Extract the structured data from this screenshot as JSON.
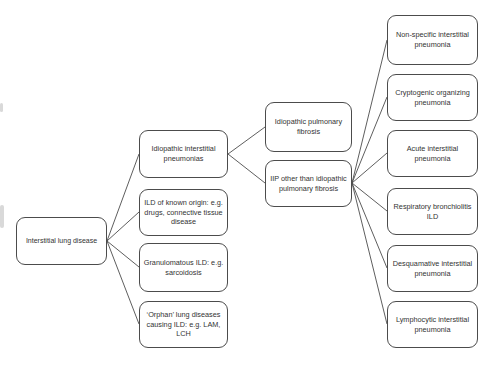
{
  "colors": {
    "background": "#ffffff",
    "box_border": "#4c4c4c",
    "text": "#333333",
    "connector": "#4c4c4c"
  },
  "diagram": {
    "root": {
      "label": "Interstitial lung disease"
    },
    "level2": [
      {
        "label": "Idiopathic interstitial pneumonias"
      },
      {
        "label": "ILD of known origin: e.g. drugs, connective tissue disease"
      },
      {
        "label": "Granulomatous ILD: e.g. sarcoidosis"
      },
      {
        "label": "‘Orphan’ lung diseases causing ILD: e.g. LAM, LCH"
      }
    ],
    "level3": [
      {
        "label": "Idiopathic pulmonary fibrosis"
      },
      {
        "label": "IIP other than idiopathic pulmonary fibrosis"
      }
    ],
    "level4": [
      {
        "label": "Non-specific interstitial pneumonia"
      },
      {
        "label": "Cryptogenic organizing pneumonia"
      },
      {
        "label": "Acute interstitial pneumonia"
      },
      {
        "label": "Respiratory bronchiolitis ILD"
      },
      {
        "label": "Desquamative interstitial pneumonia"
      },
      {
        "label": "Lymphocytic interstitial pneumonia"
      }
    ]
  }
}
